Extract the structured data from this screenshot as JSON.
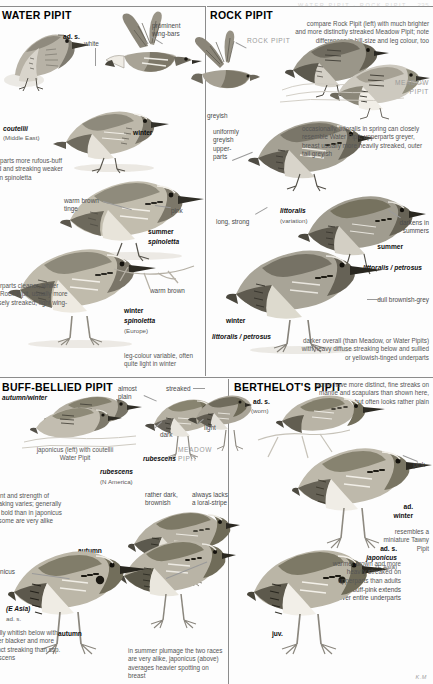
{
  "page": {
    "running_head_left": "PIPITS",
    "running_head_right": "WATER PIPIT · ROCK PIPIT",
    "folio": "235",
    "artist_signature": "K.M"
  },
  "panels": [
    {
      "id": "water-pipit",
      "title": "WATER PIPIT",
      "labels": [
        {
          "name": "ad-s",
          "text": "ad. s.",
          "style": "tag"
        },
        {
          "name": "white",
          "text": "white",
          "style": "lbl"
        },
        {
          "name": "prominent-wing-bars",
          "text": "prominent\nwing-bars",
          "style": "lbl"
        },
        {
          "name": "coutellii",
          "text": "coutellii",
          "style": "tag-italic"
        },
        {
          "name": "coutellii-region",
          "text": "(Middle East)",
          "style": "sub"
        },
        {
          "name": "winter",
          "text": "winter",
          "style": "tag"
        },
        {
          "name": "warm-brown-tinge",
          "text": "warm brown\ntinge",
          "style": "lbl"
        },
        {
          "name": "pink",
          "text": "pink",
          "style": "lbl"
        },
        {
          "name": "summer",
          "text": "summer",
          "style": "tag"
        },
        {
          "name": "spinoletta-summer",
          "text": "spinoletta",
          "style": "tag-italic"
        },
        {
          "name": "warm-brown",
          "text": "warm brown",
          "style": "lbl"
        },
        {
          "name": "winter-2",
          "text": "winter",
          "style": "tag"
        },
        {
          "name": "spinoletta-winter",
          "text": "spinoletta",
          "style": "tag-italic"
        },
        {
          "name": "spinoletta-region",
          "text": "(Europe)",
          "style": "sub"
        }
      ],
      "notes": [
        {
          "name": "coutellii-note",
          "text": "underparts more rufous-buff tinged and streaking weaker than in spinoletta"
        },
        {
          "name": "underparts-note",
          "text": "underparts cleaner, whiter than Rock Pipit, usually more sparsely streaked; light wing-bars"
        },
        {
          "name": "leg-colour-note",
          "text": "leg-colour variable, often quite light in winter"
        }
      ]
    },
    {
      "id": "rock-pipit",
      "title": "ROCK PIPIT",
      "labels": [
        {
          "name": "rock-pipit-callout",
          "text": "ROCK PIPIT",
          "style": "ghost"
        },
        {
          "name": "meadow-pipit-callout",
          "text": "MEADOW\nPIPIT",
          "style": "ghost"
        },
        {
          "name": "greyish",
          "text": "greyish",
          "style": "lbl"
        },
        {
          "name": "uniformly-greyish-upperparts",
          "text": "uniformly\ngreyish\nupper-\nparts",
          "style": "lbl"
        },
        {
          "name": "littoralis",
          "text": "littoralis",
          "style": "tag-italic"
        },
        {
          "name": "littoralis-variation",
          "text": "(variation)",
          "style": "sub"
        },
        {
          "name": "long-strong",
          "text": "long, strong",
          "style": "lbl"
        },
        {
          "name": "darkens-in-summers",
          "text": "darkens in\nsummers",
          "style": "lbl"
        },
        {
          "name": "summer",
          "text": "summer",
          "style": "tag"
        },
        {
          "name": "littoralis-petrosus-summer",
          "text": "littoralis / petrosus",
          "style": "tag-italic"
        },
        {
          "name": "dull-brownish-grey",
          "text": "dull brownish-grey",
          "style": "lbl"
        },
        {
          "name": "winter",
          "text": "winter",
          "style": "tag"
        },
        {
          "name": "littoralis-petrosus-winter",
          "text": "littoralis / petrosus",
          "style": "tag-italic"
        }
      ],
      "notes": [
        {
          "name": "compare-note",
          "text": "compare Rock Pipit (left) with much brighter and more distinctly streaked Meadow Pipit; note differences in bill-size and leg colour, too"
        },
        {
          "name": "littoralis-note",
          "text": "occasionally, littoralis in spring can closely resemble Water Pipit; upperparts greyer, breast usually more heavily streaked, outer tail greyish"
        },
        {
          "name": "darker-note",
          "text": "darker overall (than Meadow, or Water Pipits) with heavy diffuse streaking below and sullied or yellowish-tinged underparts"
        }
      ]
    },
    {
      "id": "buff-bellied-pipit",
      "title": "BUFF-BELLIED PIPIT",
      "labels": [
        {
          "name": "autumn-winter",
          "text": "autumn/winter",
          "style": "tag-italic"
        },
        {
          "name": "almost-plain",
          "text": "almost\nplain",
          "style": "lbl"
        },
        {
          "name": "streaked",
          "text": "streaked",
          "style": "lbl"
        },
        {
          "name": "dark",
          "text": "dark",
          "style": "lbl"
        },
        {
          "name": "light",
          "text": "light",
          "style": "lbl"
        },
        {
          "name": "rubescens-bird",
          "text": "rubescens",
          "style": "tag-italic"
        },
        {
          "name": "meadow-pipit-callout",
          "text": "MEADOW\nPIPIT",
          "style": "ghost"
        },
        {
          "name": "rubescens-group",
          "text": "rubescens",
          "style": "tag-italic"
        },
        {
          "name": "rubescens-region",
          "text": "(N America)",
          "style": "sub"
        },
        {
          "name": "rather-dark-brownish",
          "text": "rather dark,\nbrownish",
          "style": "lbl"
        },
        {
          "name": "always-lacks-loral-stripe",
          "text": "always lacks\na loral-stripe",
          "style": "lbl"
        },
        {
          "name": "autumn-1",
          "text": "autumn",
          "style": "tag"
        },
        {
          "name": "autumn-2",
          "text": "autumn",
          "style": "tag"
        },
        {
          "name": "large-dark-patch",
          "text": "large, dark\npatch",
          "style": "lbl"
        },
        {
          "name": "japonicus",
          "text": "japonicus",
          "style": "tag-italic"
        },
        {
          "name": "japonicus-region",
          "text": "(E Asia)",
          "style": "sub"
        },
        {
          "name": "ad-s-japonicus",
          "text": "ad. s.",
          "style": "tag"
        },
        {
          "name": "ad-s-japonicus-race",
          "text": "japonicus",
          "style": "tag-italic"
        },
        {
          "name": "ad-s-japonicus-region",
          "text": "(E Asia)",
          "style": "sub"
        },
        {
          "name": "buff-pink-note",
          "text": "buff-pink extends\nover entire underparts",
          "style": "lbl"
        }
      ],
      "notes": [
        {
          "name": "japonicus-coutellii-note",
          "text": "japonicus (left) with coutellii Water Pipit"
        },
        {
          "name": "streaking-note",
          "text": "extent and strength of streaking varies; generally less bold than in japonicus but some are very alike"
        },
        {
          "name": "whitish-note",
          "text": "usually whitish below with bolder blacker and more distinct streaking than ssp. rubescens"
        },
        {
          "name": "summer-plumage-note",
          "text": "in summer plumage the two races are very alike, japonicus (above) averages heavier spotting on breast"
        }
      ]
    },
    {
      "id": "berthelots-pipit",
      "title": "BERTHELOT'S PIPIT",
      "labels": [
        {
          "name": "ad-s",
          "text": "ad. s.",
          "style": "tag"
        },
        {
          "name": "ad-s-worn",
          "text": "(worn)",
          "style": "sub"
        },
        {
          "name": "pink",
          "text": "pink",
          "style": "lbl"
        },
        {
          "name": "ad-winter",
          "text": "ad.\nwinter",
          "style": "tag"
        },
        {
          "name": "juv",
          "text": "juv.",
          "style": "tag"
        }
      ],
      "notes": [
        {
          "name": "fine-streaks-note",
          "text": "some have more distinct, fine streaks on mantle and scapulars than shown here, but often looks rather plain"
        },
        {
          "name": "tawny-pipit-note",
          "text": "resembles a miniature Tawny Pipit"
        },
        {
          "name": "juv-note",
          "text": "warmer brown and more heavily streaked on upperparts than adults"
        }
      ]
    }
  ],
  "colors": {
    "ink": "#1a1a1a",
    "caption": "#4a4a4a",
    "ghost": "#9a9a9a",
    "rule": "#8c8c8c",
    "paper": "#fdfdfd",
    "plumage_dark": "#5d5b54",
    "plumage_mid": "#8d897e",
    "plumage_light": "#c9c4b8",
    "belly": "#f0ece3"
  }
}
